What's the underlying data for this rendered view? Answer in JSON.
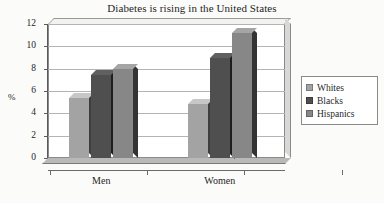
{
  "chart_data": {
    "type": "bar",
    "title": "Diabetes is rising in the United States",
    "xlabel": "",
    "ylabel": "%",
    "categories": [
      "Men",
      "Women"
    ],
    "series": [
      {
        "name": "Whites",
        "values": [
          5.4,
          4.8
        ],
        "color": "#a3a3a3"
      },
      {
        "name": "Blacks",
        "values": [
          7.4,
          9.0
        ],
        "color": "#4f4f4f"
      },
      {
        "name": "Hispanics",
        "values": [
          8.0,
          11.2
        ],
        "color": "#878787"
      }
    ],
    "ylim": [
      0,
      12
    ],
    "yticks": [
      0,
      2,
      4,
      6,
      8,
      10,
      12
    ],
    "ytick_labels": [
      "0",
      "2",
      "4",
      "6",
      "8",
      "10",
      "12"
    ],
    "grid": true,
    "legend_position": "right",
    "style": "3d-grouped-bars"
  },
  "legend": {
    "items": [
      {
        "label": "Whites"
      },
      {
        "label": "Blacks"
      },
      {
        "label": "Hispanics"
      }
    ]
  }
}
